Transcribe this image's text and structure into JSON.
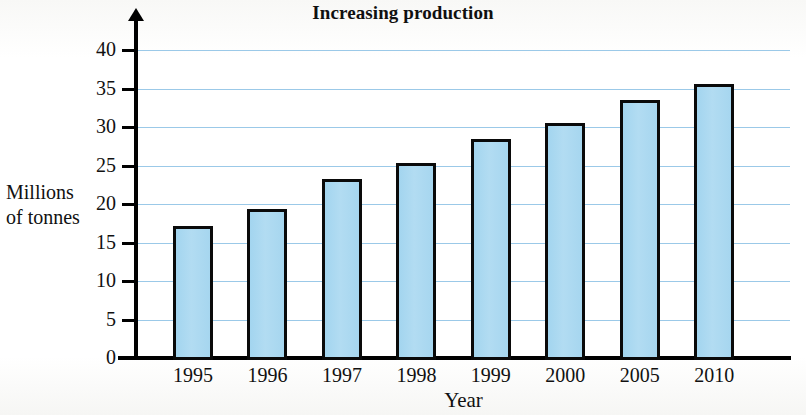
{
  "chart_data": {
    "type": "bar",
    "title": "Increasing production",
    "xlabel": "Year",
    "ylabel": "Millions of tonnes",
    "ylabel_lines": [
      "Millions",
      "of tonnes"
    ],
    "categories": [
      "1995",
      "1996",
      "1997",
      "1998",
      "1999",
      "2000",
      "2005",
      "2010"
    ],
    "values": [
      17.2,
      19.3,
      23.2,
      25.3,
      28.4,
      30.5,
      33.5,
      35.6
    ],
    "ylim": [
      0,
      40
    ],
    "ytick_labels": [
      "0",
      "5",
      "10",
      "15",
      "20",
      "25",
      "30",
      "35",
      "40"
    ],
    "ytick_values": [
      0,
      5,
      10,
      15,
      20,
      25,
      30,
      35,
      40
    ],
    "grid": "horizontal",
    "gridline_values": [
      5,
      10,
      15,
      20,
      25,
      30,
      35,
      40
    ],
    "legend": "none",
    "colors": {
      "bar_fill": "#a8d8f0",
      "bar_border": "#0a0a0a",
      "gridline": "#93c4e6",
      "axis": "#000000",
      "text": "#111111",
      "background": "#fdfdfb"
    }
  }
}
